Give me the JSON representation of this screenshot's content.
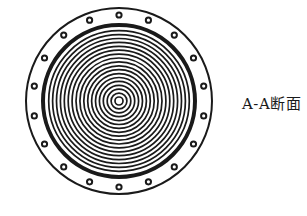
{
  "figure": {
    "type": "cross-section",
    "label": "A-A断面",
    "colors": {
      "ink": "#1a1a1a",
      "background": "#ffffff"
    },
    "geometry": {
      "center": [
        119,
        101
      ],
      "outer_radius": 93,
      "bolt_circle_radius": 86,
      "bolt_count": 18,
      "bolt_outer_radius": 3.6,
      "bolt_inner_radius": 1.6,
      "thick_ring_radius": 76,
      "thick_ring_width": 4,
      "concentric_ring_count": 18,
      "innermost_ring_radius": 4,
      "concentric_ring_spacing": 3.9
    }
  }
}
